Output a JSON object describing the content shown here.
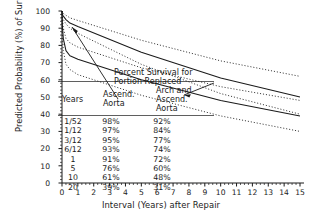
{
  "chart_data": {
    "type": "line",
    "title": "",
    "xlabel": "Interval (Years) after Repair",
    "ylabel": "Predicted Probability (%) of Survival",
    "xlim": [
      0,
      15
    ],
    "ylim": [
      0,
      100
    ],
    "xticks": [
      "0",
      "1",
      "2",
      "3",
      "4",
      "5",
      "6",
      "7",
      "8",
      "9",
      "10",
      "11",
      "12",
      "13",
      "14",
      "15"
    ],
    "yticks": [
      "0",
      "10",
      "20",
      "30",
      "40",
      "50",
      "60",
      "70",
      "80",
      "90",
      "100"
    ],
    "grid": false,
    "legend_position": "inline-annotations",
    "annotations": [
      "Percent Survival for Portion Replaced",
      "Years",
      "Ascend. Aorta",
      "Arch and Ascend. Aorta"
    ],
    "series": [
      {
        "name": "Ascend. Aorta",
        "style": "solid",
        "x": [
          0,
          0.019,
          0.083,
          0.25,
          0.5,
          1,
          5,
          10,
          15
        ],
        "values": [
          100,
          98,
          97,
          95,
          93,
          91,
          76,
          61,
          50
        ]
      },
      {
        "name": "Ascend. Aorta upper 70% CL",
        "style": "dotted",
        "x": [
          0,
          0.019,
          0.083,
          0.25,
          0.5,
          1,
          5,
          10,
          15
        ],
        "values": [
          100,
          99,
          98.5,
          97.5,
          96,
          94.5,
          83,
          71,
          62
        ]
      },
      {
        "name": "Ascend. Aorta lower 70% CL",
        "style": "dotted",
        "x": [
          0,
          0.019,
          0.083,
          0.25,
          0.5,
          1,
          5,
          10,
          15
        ],
        "values": [
          100,
          96.5,
          95,
          92.5,
          90,
          87,
          69,
          52,
          40
        ]
      },
      {
        "name": "Arch and Ascend. Aorta",
        "style": "solid",
        "x": [
          0,
          0.019,
          0.083,
          0.25,
          0.5,
          1,
          5,
          10,
          15
        ],
        "values": [
          100,
          92,
          84,
          77,
          74,
          72,
          60,
          48,
          39
        ]
      },
      {
        "name": "Arch and Ascend. Aorta upper 70% CL",
        "style": "dotted",
        "x": [
          0,
          0.019,
          0.083,
          0.25,
          0.5,
          1,
          5,
          10,
          15
        ],
        "values": [
          100,
          96,
          90,
          84,
          81.5,
          79,
          67,
          56,
          48
        ]
      },
      {
        "name": "Arch and Ascend. Aorta lower 70% CL",
        "style": "dotted",
        "x": [
          0,
          0.019,
          0.083,
          0.25,
          0.5,
          1,
          5,
          10,
          15
        ],
        "values": [
          100,
          87,
          77,
          69,
          66,
          63,
          51,
          39,
          30
        ]
      }
    ],
    "table": {
      "header_title": "Percent Survival for Portion Replaced",
      "columns": [
        "Years",
        "Ascend. Aorta",
        "Arch and Ascend. Aorta"
      ],
      "rows": [
        [
          "1/52",
          "98%",
          "92%"
        ],
        [
          "1/12",
          "97%",
          "84%"
        ],
        [
          "3/12",
          "95%",
          "77%"
        ],
        [
          "6/12",
          "93%",
          "74%"
        ],
        [
          "1",
          "91%",
          "72%"
        ],
        [
          "5",
          "76%",
          "60%"
        ],
        [
          "10",
          "61%",
          "48%"
        ],
        [
          "20",
          "39%",
          "31%"
        ]
      ]
    }
  },
  "axes": {
    "xlabel": "Interval (Years) after Repair",
    "ylabel": "Predicted Probability (%) of Survival"
  },
  "annotations": {
    "table_title_line1": "Percent Survival for",
    "table_title_line2": "Portion Replaced",
    "years_label": "Years",
    "col_a_line1": "Ascend.",
    "col_a_line2": "Aorta",
    "col_b_line1": "Arch and",
    "col_b_line2": "Ascend.",
    "col_b_line3": "Aorta"
  },
  "colors": {
    "ink": "#1a1a1a",
    "background": "#ffffff"
  }
}
